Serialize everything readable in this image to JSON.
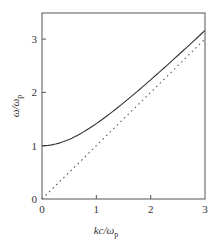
{
  "chart_data": {
    "type": "line",
    "title": "",
    "xlabel": "kc/ω_p",
    "ylabel": "ω/ω_p",
    "xlim": [
      0,
      3
    ],
    "ylim": [
      0,
      3.5
    ],
    "xticks": [
      0,
      1,
      2,
      3
    ],
    "yticks": [
      0,
      1,
      2,
      3
    ],
    "grid": false,
    "legend": null,
    "series": [
      {
        "name": "dispersion ω = sqrt(ω_p² + k²c²)",
        "style": "solid",
        "x": [
          0,
          0.25,
          0.5,
          0.75,
          1.0,
          1.25,
          1.5,
          1.75,
          2.0,
          2.25,
          2.5,
          2.75,
          3.0
        ],
        "y": [
          1.0,
          1.03,
          1.12,
          1.25,
          1.41,
          1.6,
          1.8,
          2.02,
          2.24,
          2.46,
          2.69,
          2.93,
          3.16
        ]
      },
      {
        "name": "light line ω = kc",
        "style": "dotted",
        "x": [
          0,
          3
        ],
        "y": [
          0,
          3
        ]
      }
    ]
  },
  "labels": {
    "x_main": "kc/ω",
    "x_sub": "p",
    "y_main": "ω/ω",
    "y_sub": "p",
    "xtick_labels": [
      "0",
      "1",
      "2",
      "3"
    ],
    "ytick_labels": [
      "0",
      "1",
      "2",
      "3"
    ]
  },
  "colors": {
    "axis": "#555555",
    "curve": "#333333",
    "dotted": "#555555"
  }
}
